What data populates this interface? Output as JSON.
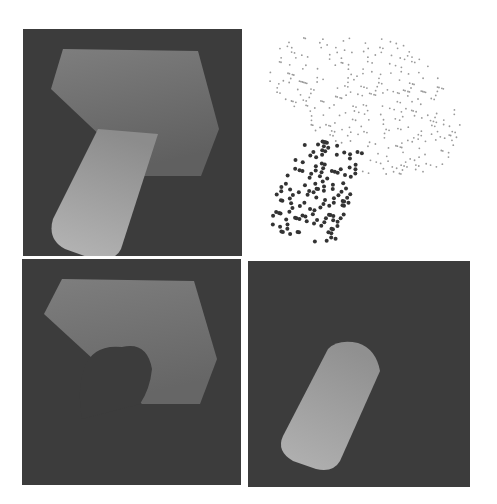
{
  "figure": {
    "panels": [
      {
        "id": "top-left",
        "content": "depth image of block with cylinder"
      },
      {
        "id": "top-right",
        "content": "point cloud, block sparse light points, cylinder dense dark points"
      },
      {
        "id": "bottom-left",
        "content": "depth image of block with cylinder removed (hole)"
      },
      {
        "id": "bottom-right",
        "content": "depth image of cylinder only"
      }
    ],
    "colors": {
      "background": "#3c3c3c",
      "block": "#7a7a7a",
      "cylinder": "#a8a8a8",
      "points_light": "#9a9a9a",
      "points_dark": "#333333"
    }
  }
}
